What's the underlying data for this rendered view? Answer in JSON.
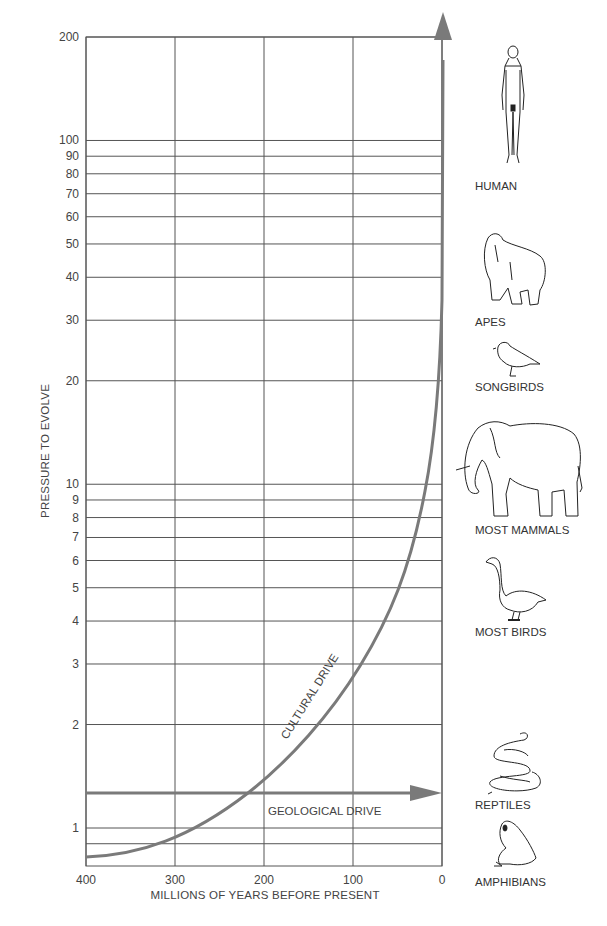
{
  "chart_data": {
    "type": "line",
    "title": "",
    "xlabel": "MILLIONS OF YEARS BEFORE PRESENT",
    "ylabel": "PRESSURE TO EVOLVE",
    "xscale": "linear",
    "yscale": "log",
    "xlim": [
      400,
      0
    ],
    "ylim": [
      0.8,
      200
    ],
    "x_ticks": [
      400,
      300,
      200,
      100,
      0
    ],
    "y_ticks": [
      1,
      2,
      3,
      4,
      5,
      6,
      7,
      8,
      9,
      10,
      20,
      30,
      40,
      50,
      60,
      70,
      80,
      90,
      100,
      200
    ],
    "y_tick_labels": [
      "1",
      "2",
      "3",
      "4",
      "5",
      "6",
      "7",
      "8",
      "9",
      "10",
      "20",
      "30",
      "40",
      "50",
      "60",
      "70",
      "80",
      "90",
      "100",
      "200"
    ],
    "extra_gridlines_y": [
      0.9
    ],
    "grid": true,
    "series": [
      {
        "name": "CULTURAL DRIVE",
        "x": [
          400,
          350,
          300,
          250,
          200,
          150,
          100,
          75,
          50,
          40,
          30,
          20,
          15,
          10,
          5,
          3,
          2,
          0
        ],
        "y": [
          0.85,
          0.88,
          0.95,
          1.12,
          1.45,
          2.1,
          3.0,
          3.9,
          5.2,
          6.0,
          7.0,
          8.6,
          10,
          13,
          20,
          30,
          50,
          200
        ],
        "style": "curve-arrow-up"
      },
      {
        "name": "GEOLOGICAL DRIVE",
        "x": [
          400,
          0
        ],
        "y": [
          1.3,
          1.3
        ],
        "style": "horizontal-arrow-right"
      }
    ],
    "annotations": [
      {
        "text": "CULTURAL DRIVE",
        "x": 155,
        "y": 2.5,
        "rotated": true
      },
      {
        "text": "GEOLOGICAL DRIVE",
        "x": 110,
        "y": 1.15
      }
    ],
    "side_labels": [
      {
        "label": "HUMAN",
        "icon": "human-figure-icon"
      },
      {
        "label": "APES",
        "icon": "gorilla-icon"
      },
      {
        "label": "SONGBIRDS",
        "icon": "songbird-icon"
      },
      {
        "label": "MOST MAMMALS",
        "icon": "elephant-icon"
      },
      {
        "label": "MOST BIRDS",
        "icon": "swan-icon"
      },
      {
        "label": "REPTILES",
        "icon": "snake-icon"
      },
      {
        "label": "AMPHIBIANS",
        "icon": "frog-icon"
      }
    ],
    "colors": {
      "curve": "#7a7a7a",
      "grid": "#555555",
      "axis_text": "#444444"
    }
  }
}
